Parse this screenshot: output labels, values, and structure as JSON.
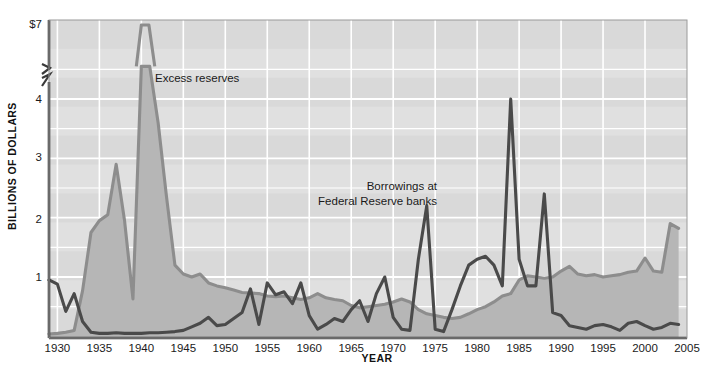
{
  "chart_data": {
    "type": "area",
    "title": "",
    "subtitle": "",
    "xlabel": "YEAR",
    "ylabel": "BILLIONS OF DOLLARS",
    "xlim": [
      1929,
      2005
    ],
    "ylim": [
      0,
      4.55
    ],
    "y_axis_break": {
      "present": true,
      "break_below": 4.55,
      "top_label": "$7",
      "note": "axis is broken between 4 and $7 so the 1940 excess-reserves peak can be shown"
    },
    "grid": true,
    "grid_color": "#ffffff",
    "legend_position": "inline-annotations",
    "xticks": [
      1930,
      1935,
      1940,
      1945,
      1950,
      1955,
      1960,
      1965,
      1970,
      1975,
      1980,
      1985,
      1990,
      1995,
      2000,
      2005
    ],
    "xticklabels": [
      "1930",
      "1935",
      "1940",
      "1945",
      "1950",
      "1955",
      "1960",
      "1965",
      "1970",
      "1975",
      "1980",
      "1985",
      "1990",
      "1995",
      "2000",
      "2005"
    ],
    "yticks": [
      1,
      2,
      3,
      4,
      7
    ],
    "yticklabels": [
      "1",
      "2",
      "3",
      "4",
      "$7"
    ],
    "annotations": [
      {
        "name": "excess-reserves-label",
        "text": "Excess reserves",
        "x": 1940.5,
        "y": 4.45,
        "lines": [
          "Excess reserves"
        ]
      },
      {
        "name": "borrowings-label",
        "text": "Borrowings at Federal Reserve banks",
        "x": 1968.5,
        "y": 2.75,
        "lines": [
          "Borrowings at",
          "Federal Reserve banks"
        ]
      }
    ],
    "series": [
      {
        "name": "Excess reserves",
        "style": "area",
        "line_color": "#8d8d8d",
        "fill_color": "#b6b6b6",
        "x": [
          1929,
          1930,
          1931,
          1932,
          1933,
          1934,
          1935,
          1936,
          1937,
          1938,
          1939,
          1940,
          1941,
          1942,
          1943,
          1944,
          1945,
          1946,
          1947,
          1948,
          1949,
          1950,
          1951,
          1952,
          1953,
          1954,
          1955,
          1956,
          1957,
          1958,
          1959,
          1960,
          1961,
          1962,
          1963,
          1964,
          1965,
          1966,
          1967,
          1968,
          1969,
          1970,
          1971,
          1972,
          1973,
          1974,
          1975,
          1976,
          1977,
          1978,
          1979,
          1980,
          1981,
          1982,
          1983,
          1984,
          1985,
          1986,
          1987,
          1988,
          1989,
          1990,
          1991,
          1992,
          1993,
          1994,
          1995,
          1996,
          1997,
          1998,
          1999,
          2000,
          2001,
          2002,
          2003,
          2004
        ],
        "values": [
          0.04,
          0.05,
          0.07,
          0.1,
          0.77,
          1.75,
          1.95,
          2.05,
          2.9,
          1.95,
          0.63,
          4.55,
          4.55,
          3.6,
          2.35,
          1.2,
          1.05,
          1.0,
          1.05,
          0.9,
          0.85,
          0.82,
          0.78,
          0.74,
          0.73,
          0.72,
          0.68,
          0.67,
          0.68,
          0.65,
          0.62,
          0.65,
          0.72,
          0.65,
          0.62,
          0.6,
          0.52,
          0.48,
          0.5,
          0.52,
          0.54,
          0.58,
          0.63,
          0.58,
          0.45,
          0.38,
          0.35,
          0.32,
          0.3,
          0.32,
          0.38,
          0.45,
          0.5,
          0.58,
          0.68,
          0.72,
          0.95,
          1.02,
          1.0,
          0.98,
          1.0,
          1.1,
          1.18,
          1.05,
          1.02,
          1.04,
          1.0,
          1.02,
          1.04,
          1.08,
          1.1,
          1.32,
          1.1,
          1.08,
          1.9,
          1.82
        ],
        "units": "billions of dollars"
      },
      {
        "name": "Borrowings at Federal Reserve banks",
        "style": "line",
        "line_color": "#4a4a4a",
        "x": [
          1929,
          1930,
          1931,
          1932,
          1933,
          1934,
          1935,
          1936,
          1937,
          1938,
          1939,
          1940,
          1941,
          1942,
          1943,
          1944,
          1945,
          1946,
          1947,
          1948,
          1949,
          1950,
          1951,
          1952,
          1953,
          1954,
          1955,
          1956,
          1957,
          1958,
          1959,
          1960,
          1961,
          1962,
          1963,
          1964,
          1965,
          1966,
          1967,
          1968,
          1969,
          1970,
          1971,
          1972,
          1973,
          1974,
          1975,
          1976,
          1977,
          1978,
          1979,
          1980,
          1981,
          1982,
          1983,
          1984,
          1985,
          1986,
          1987,
          1988,
          1989,
          1990,
          1991,
          1992,
          1993,
          1994,
          1995,
          1996,
          1997,
          1998,
          1999,
          2000,
          2001,
          2002,
          2003,
          2004
        ],
        "values": [
          0.95,
          0.88,
          0.42,
          0.72,
          0.25,
          0.07,
          0.05,
          0.05,
          0.06,
          0.05,
          0.05,
          0.05,
          0.06,
          0.06,
          0.07,
          0.08,
          0.1,
          0.16,
          0.22,
          0.32,
          0.18,
          0.2,
          0.3,
          0.4,
          0.8,
          0.2,
          0.9,
          0.7,
          0.75,
          0.55,
          0.9,
          0.35,
          0.12,
          0.2,
          0.3,
          0.25,
          0.45,
          0.6,
          0.25,
          0.72,
          1.0,
          0.32,
          0.12,
          0.1,
          1.3,
          2.2,
          0.12,
          0.08,
          0.45,
          0.85,
          1.2,
          1.3,
          1.35,
          1.2,
          0.85,
          4.0,
          1.3,
          0.85,
          0.85,
          2.4,
          0.4,
          0.35,
          0.18,
          0.15,
          0.12,
          0.18,
          0.2,
          0.16,
          0.1,
          0.22,
          0.25,
          0.18,
          0.12,
          0.15,
          0.22,
          0.2
        ],
        "units": "billions of dollars"
      }
    ],
    "colors": {
      "plot_background": "#d8d8d8",
      "band_background": "#dedede",
      "gridline": "#ffffff",
      "axis": "#3a3a3a",
      "excess_reserves_line": "#8d8d8d",
      "excess_reserves_fill": "#b6b6b6",
      "borrowings_line": "#4a4a4a",
      "text": "#1a1a1a"
    }
  },
  "axis": {
    "y_label": "BILLIONS OF DOLLARS",
    "x_label": "YEAR",
    "y_top_label": "$7",
    "y_ticks": [
      "4",
      "3",
      "2",
      "1"
    ],
    "x_ticks": [
      "1930",
      "1935",
      "1940",
      "1945",
      "1950",
      "1955",
      "1960",
      "1965",
      "1970",
      "1975",
      "1980",
      "1985",
      "1990",
      "1995",
      "2000",
      "2005"
    ]
  },
  "annotations": {
    "excess_reserves": "Excess reserves",
    "borrowings_line1": "Borrowings at",
    "borrowings_line2": "Federal Reserve banks"
  }
}
